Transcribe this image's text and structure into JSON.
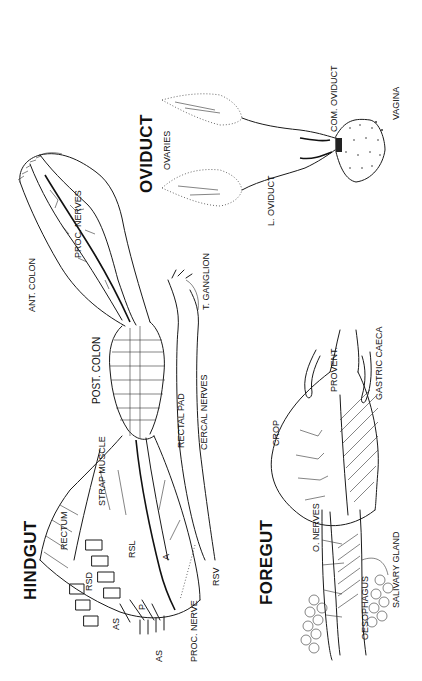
{
  "diagram": {
    "orientation": "rotated -90deg (text reads bottom-to-top)",
    "ink_color": "#1a1a1a",
    "background": "#ffffff",
    "sections": [
      {
        "id": "hindgut",
        "title": "HINDGUT",
        "labels": {
          "rectum": "RECTUM",
          "rsd": "RSD",
          "rsl": "RSL",
          "rsv": "RSV",
          "as_upper": "AS",
          "as_lower": "AS",
          "p": "P",
          "a": "A",
          "strap_muscle": "STRAP MUSCLE",
          "proc_nerve": "PROC. NERVE",
          "post_colon": "POST. COLON",
          "rectal_pad": "RECTAL PAD",
          "cercal_nerves": "CERCAL NERVES",
          "ant_colon": "ANT. COLON",
          "proc_nerves": "PROC. NERVES",
          "t_ganglion": "T. GANGLION"
        }
      },
      {
        "id": "foregut",
        "title": "FOREGUT",
        "labels": {
          "crop": "CROP",
          "provent": "PROVENT.",
          "gastric_caeca": "GASTRIC CAECA",
          "o_nerves": "O. NERVES",
          "oesophagus": "OESOPHAGUS",
          "salivary_gland": "SALIVARY GLAND"
        }
      },
      {
        "id": "oviduct",
        "title": "OVIDUCT",
        "labels": {
          "ovaries": "OVARIES",
          "l_oviduct": "L. OVIDUCT",
          "com_oviduct": "COM. OVIDUCT",
          "vagina": "VAGINA"
        }
      }
    ]
  }
}
